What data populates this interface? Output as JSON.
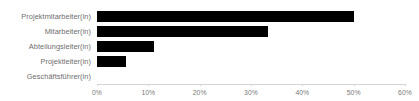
{
  "chart_data": {
    "type": "bar",
    "orientation": "horizontal",
    "title": "",
    "subtitle": "",
    "xlabel": "",
    "ylabel": "",
    "categories": [
      "Projektmitarbeiter(in)",
      "Mitarbeiter(in)",
      "Abteilungsleiter(in)",
      "Projektleiter(in)",
      "Geschäftsführer(in)"
    ],
    "values": [
      50,
      33.3,
      11.2,
      5.6,
      0
    ],
    "value_labels": [
      "50%",
      "33%",
      "11%",
      "6%",
      "0%"
    ],
    "xlim": [
      0,
      60
    ],
    "xtick_values": [
      0,
      10,
      20,
      30,
      40,
      50,
      60
    ],
    "xtick_labels": [
      "0%",
      "10%",
      "20%",
      "30%",
      "40%",
      "50%",
      "60%"
    ],
    "grid": false,
    "legend": false,
    "bar_color": "#000000",
    "axis_color": "#d4d4d4",
    "label_color": "#6e6e6e",
    "tick_label_color": "#7a7a7a",
    "background_color": "#ffffff"
  }
}
